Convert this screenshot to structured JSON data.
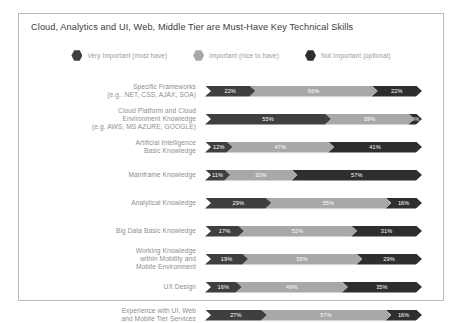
{
  "chart": {
    "title": "Cloud, Analytics and UI, Web, Middle Tier are Must-Have Key Technical Skills"
  },
  "legend": {
    "items": [
      {
        "label": "Very Important (must have)",
        "color": "#3f3f3f",
        "marker": "hexagon-marker"
      },
      {
        "label": "Important (nice to have)",
        "color": "#a8a8a8",
        "marker": "hexagon-marker"
      },
      {
        "label": "Not Important (optional)",
        "color": "#2e2e2e",
        "marker": "hexagon-marker"
      }
    ]
  },
  "chart_data": {
    "type": "bar",
    "subtype": "stacked-horizontal-100-percent",
    "title": "Cloud, Analytics and UI, Web, Middle Tier are Must-Have Key Technical Skills",
    "xlabel": "",
    "ylabel": "",
    "xlim": [
      0,
      100
    ],
    "grid": false,
    "legend_position": "top-center",
    "value_suffix": "%",
    "categories": [
      "Specific Frameworks (e.g. .NET, CSS, AJAX, SOA)",
      "Cloud Platform and Cloud Environment Knowledge (e.g. AWS, MS AZURE, GOOGLE)",
      "Artificial Intelligence Basic Knowledge",
      "Mainframe Knowledge",
      "Analytical Knowledge",
      "Big Data Basic Knowledge",
      "Working Knowledge within Mobility and Mobile Environment",
      "UX Design",
      "Experience with UI, Web and Mobile Tier Services"
    ],
    "series": [
      {
        "name": "Very Important (must have)",
        "color": "#3f3f3f",
        "values": [
          22,
          55,
          12,
          11,
          29,
          17,
          19,
          16,
          27
        ]
      },
      {
        "name": "Important (nice to have)",
        "color": "#a8a8a8",
        "values": [
          56,
          39,
          47,
          32,
          55,
          52,
          53,
          49,
          57
        ]
      },
      {
        "name": "Not Important (optional)",
        "color": "#2e2e2e",
        "values": [
          22,
          6,
          41,
          57,
          16,
          31,
          29,
          35,
          16
        ]
      }
    ]
  },
  "rows": [
    {
      "label_lines": [
        "Specific Frameworks",
        "(e.g. .NET, CSS, AJAX, SOA)"
      ],
      "segments": [
        {
          "value": 22,
          "text": "22%",
          "color": "#3f3f3f"
        },
        {
          "value": 56,
          "text": "56%",
          "color": "#a8a8a8"
        },
        {
          "value": 22,
          "text": "22%",
          "color": "#2e2e2e"
        }
      ]
    },
    {
      "label_lines": [
        "Cloud Platform and Cloud",
        "Environment Knowledge",
        "(e.g. AWS, MS AZURE, GOOGLE)"
      ],
      "segments": [
        {
          "value": 55,
          "text": "55%",
          "color": "#3f3f3f"
        },
        {
          "value": 39,
          "text": "39%",
          "color": "#a8a8a8"
        },
        {
          "value": 6,
          "text": "6%",
          "color": "#2e2e2e"
        }
      ]
    },
    {
      "label_lines": [
        "Artificial Intelligence",
        "Basic Knowledge"
      ],
      "segments": [
        {
          "value": 12,
          "text": "12%",
          "color": "#3f3f3f"
        },
        {
          "value": 47,
          "text": "47%",
          "color": "#a8a8a8"
        },
        {
          "value": 41,
          "text": "41%",
          "color": "#2e2e2e"
        }
      ]
    },
    {
      "label_lines": [
        "Mainframe Knowledge"
      ],
      "segments": [
        {
          "value": 11,
          "text": "11%",
          "color": "#3f3f3f"
        },
        {
          "value": 32,
          "text": "32%",
          "color": "#a8a8a8"
        },
        {
          "value": 57,
          "text": "57%",
          "color": "#2e2e2e"
        }
      ]
    },
    {
      "label_lines": [
        "Analytical Knowledge"
      ],
      "segments": [
        {
          "value": 29,
          "text": "29%",
          "color": "#3f3f3f"
        },
        {
          "value": 55,
          "text": "55%",
          "color": "#a8a8a8"
        },
        {
          "value": 16,
          "text": "16%",
          "color": "#2e2e2e"
        }
      ]
    },
    {
      "label_lines": [
        "Big Data Basic Knowledge"
      ],
      "segments": [
        {
          "value": 17,
          "text": "17%",
          "color": "#3f3f3f"
        },
        {
          "value": 52,
          "text": "52%",
          "color": "#a8a8a8"
        },
        {
          "value": 31,
          "text": "31%",
          "color": "#2e2e2e"
        }
      ]
    },
    {
      "label_lines": [
        "Working Knowledge",
        "within Mobility and",
        "Mobile Environment"
      ],
      "segments": [
        {
          "value": 19,
          "text": "19%",
          "color": "#3f3f3f"
        },
        {
          "value": 53,
          "text": "53%",
          "color": "#a8a8a8"
        },
        {
          "value": 29,
          "text": "29%",
          "color": "#2e2e2e"
        }
      ]
    },
    {
      "label_lines": [
        "UX Design"
      ],
      "segments": [
        {
          "value": 16,
          "text": "16%",
          "color": "#3f3f3f"
        },
        {
          "value": 49,
          "text": "49%",
          "color": "#a8a8a8"
        },
        {
          "value": 35,
          "text": "35%",
          "color": "#2e2e2e"
        }
      ]
    },
    {
      "label_lines": [
        "Experience with UI, Web",
        "and Mobile Tier Services"
      ],
      "segments": [
        {
          "value": 27,
          "text": "27%",
          "color": "#3f3f3f"
        },
        {
          "value": 57,
          "text": "57%",
          "color": "#a8a8a8"
        },
        {
          "value": 16,
          "text": "16%",
          "color": "#2e2e2e"
        }
      ]
    }
  ]
}
